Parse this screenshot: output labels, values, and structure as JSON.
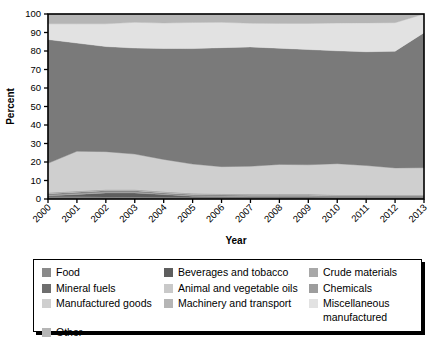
{
  "chart_data": {
    "type": "area",
    "title": "",
    "subtitle": "",
    "xlabel": "Year",
    "ylabel": "Percent",
    "stacked": true,
    "grid": false,
    "legend_position": "bottom",
    "ylim": [
      0,
      100
    ],
    "yticks": [
      0,
      10,
      20,
      30,
      40,
      50,
      60,
      70,
      80,
      90,
      100
    ],
    "categories": [
      "2000",
      "2001",
      "2002",
      "2003",
      "2004",
      "2005",
      "2006",
      "2007",
      "2008",
      "2009",
      "2010",
      "2011",
      "2012",
      "2013"
    ],
    "x": [
      2000,
      2001,
      2002,
      2003,
      2004,
      2005,
      2006,
      2007,
      2008,
      2009,
      2010,
      2011,
      2012,
      2013
    ],
    "series": [
      {
        "name": "Food",
        "color": "#8a8a8a",
        "values": [
          1.2,
          1.2,
          1.1,
          1.0,
          0.9,
          0.8,
          0.8,
          0.7,
          0.7,
          0.7,
          0.6,
          0.6,
          0.6,
          0.6
        ]
      },
      {
        "name": "Beverages and tobacco",
        "color": "#5e5e5e",
        "values": [
          0.5,
          1.3,
          2.2,
          2.3,
          1.5,
          0.7,
          0.5,
          0.4,
          0.4,
          0.4,
          0.3,
          0.3,
          0.3,
          0.3
        ]
      },
      {
        "name": "Crude materials",
        "color": "#a8a8a8",
        "values": [
          0.6,
          0.6,
          0.6,
          0.6,
          0.5,
          0.5,
          0.5,
          0.5,
          0.5,
          0.5,
          0.4,
          0.4,
          0.4,
          0.4
        ]
      },
      {
        "name": "Mineral fuels",
        "color": "#6e6e6e",
        "values": [
          0.5,
          0.5,
          0.5,
          0.5,
          0.4,
          0.4,
          0.4,
          0.4,
          0.4,
          0.4,
          0.3,
          0.3,
          0.3,
          0.3
        ]
      },
      {
        "name": "Animal and vegetable oils",
        "color": "#c9c9c9",
        "values": [
          0.3,
          0.3,
          0.3,
          0.3,
          0.3,
          0.3,
          0.3,
          0.3,
          0.3,
          0.3,
          0.3,
          0.3,
          0.3,
          0.3
        ]
      },
      {
        "name": "Chemicals",
        "color": "#9d9d9d",
        "values": [
          0.4,
          0.4,
          0.4,
          0.4,
          0.4,
          0.4,
          0.4,
          0.4,
          0.4,
          0.4,
          0.4,
          0.4,
          0.4,
          0.4
        ]
      },
      {
        "name": "Manufactured goods",
        "color": "#cfcfcf",
        "values": [
          15.8,
          21.5,
          20.5,
          19.2,
          17.4,
          15.8,
          14.6,
          15.0,
          16.0,
          15.8,
          16.8,
          15.8,
          14.5,
          14.6
        ]
      },
      {
        "name": "Machinery and transport",
        "color": "#7a7a7a",
        "values": [
          66.9,
          58.5,
          56.8,
          57.3,
          60.0,
          62.4,
          64.3,
          64.5,
          62.8,
          62.3,
          61.0,
          61.5,
          63.1,
          73.0
        ]
      },
      {
        "name": "Miscellaneous manufactured",
        "color": "#e2e2e2",
        "values": [
          8.5,
          10.4,
          12.3,
          13.9,
          13.7,
          14.1,
          13.7,
          12.8,
          13.4,
          14.1,
          15.0,
          15.6,
          15.4,
          10.1
        ]
      },
      {
        "name": "Other",
        "color": "#b5b5b5",
        "values": [
          5.3,
          5.3,
          5.3,
          4.5,
          4.9,
          4.6,
          4.5,
          5.0,
          5.1,
          5.1,
          4.9,
          4.8,
          4.7,
          0.0
        ]
      }
    ]
  },
  "legend": {
    "items": [
      {
        "label": "Food",
        "color": "#8a8a8a"
      },
      {
        "label": "Beverages and tobacco",
        "color": "#5e5e5e"
      },
      {
        "label": "Crude materials",
        "color": "#a8a8a8"
      },
      {
        "label": "Mineral fuels",
        "color": "#6e6e6e"
      },
      {
        "label": "Animal and vegetable oils",
        "color": "#c9c9c9"
      },
      {
        "label": "Chemicals",
        "color": "#9d9d9d"
      },
      {
        "label": "Manufactured goods",
        "color": "#cfcfcf"
      },
      {
        "label": "Machinery and transport",
        "color": "#b5b5b5"
      },
      {
        "label": "Miscellaneous manufactured",
        "color": "#e2e2e2"
      },
      {
        "label": "Other",
        "color": "#b5b5b5"
      }
    ]
  },
  "axes": {
    "y_title": "Percent",
    "x_title": "Year"
  }
}
